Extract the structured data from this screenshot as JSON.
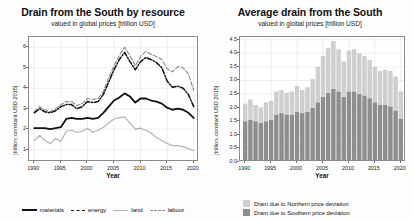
{
  "figure": {
    "background": "#fdfdfd",
    "width": 413,
    "height": 221
  },
  "panels": [
    {
      "id": "left",
      "title": "Drain from the South by resource",
      "subtitle": "valued in global prices [trillion USD]",
      "xlabel": "Year",
      "ylabel": "[trillion, constant USD 2015]"
    },
    {
      "id": "right",
      "title": "Average drain from the South",
      "subtitle": "valued in global prices [trillion USD]",
      "xlabel": "Year",
      "ylabel": "[trillion, constant USD 2015]"
    }
  ],
  "colors": {
    "materials": "#111111",
    "energy": "#111111",
    "land": "#b3b3b3",
    "labour": "#8f8f8f",
    "north_bar": "#cfcfcf",
    "south_bar": "#8e8e8e",
    "axis": "#8a8a8a",
    "grid": "#e9e9e9"
  },
  "chart_data": [
    {
      "type": "line",
      "id": "drain-by-resource",
      "title": "Drain from the South by resource",
      "subtitle": "valued in global prices [trillion USD]",
      "xlabel": "Year",
      "ylabel": "[trillion, constant USD 2015]",
      "xlim": [
        1989,
        2021
      ],
      "ylim": [
        0.4,
        6.5
      ],
      "xticks": [
        1990,
        1995,
        2000,
        2005,
        2010,
        2015,
        2020
      ],
      "yticks": [
        1,
        2,
        3,
        4,
        5,
        6
      ],
      "grid": true,
      "legend_position": "bottom",
      "x": [
        1990,
        1991,
        1992,
        1993,
        1994,
        1995,
        1996,
        1997,
        1998,
        1999,
        2000,
        2001,
        2002,
        2003,
        2004,
        2005,
        2006,
        2007,
        2008,
        2009,
        2010,
        2011,
        2012,
        2013,
        2014,
        2015,
        2016,
        2017,
        2018,
        2019,
        2020
      ],
      "series": [
        {
          "name": "materials",
          "style": "solid",
          "color": "#111111",
          "values": [
            2.05,
            2.05,
            2.05,
            2.0,
            2.05,
            2.1,
            2.5,
            2.55,
            2.5,
            2.5,
            2.55,
            2.5,
            2.55,
            2.8,
            3.1,
            3.4,
            3.55,
            3.75,
            3.6,
            3.3,
            3.5,
            3.5,
            3.4,
            3.35,
            3.25,
            3.05,
            2.95,
            3.0,
            2.95,
            2.8,
            2.55
          ]
        },
        {
          "name": "energy",
          "style": "dashdot",
          "color": "#111111",
          "values": [
            2.8,
            3.0,
            2.85,
            2.8,
            2.9,
            3.1,
            3.2,
            3.2,
            3.0,
            3.1,
            3.35,
            3.3,
            3.35,
            3.7,
            4.3,
            4.9,
            5.4,
            5.75,
            5.3,
            4.9,
            5.3,
            5.5,
            5.4,
            5.25,
            5.0,
            4.35,
            4.05,
            4.1,
            4.0,
            3.7,
            3.1
          ]
        },
        {
          "name": "land",
          "style": "solid",
          "color": "#b3b3b3",
          "values": [
            1.45,
            1.7,
            1.45,
            1.3,
            1.55,
            1.4,
            1.9,
            1.95,
            1.85,
            1.9,
            2.05,
            1.85,
            1.95,
            2.1,
            2.3,
            2.5,
            2.55,
            2.6,
            2.3,
            2.0,
            2.05,
            1.95,
            1.8,
            1.6,
            1.45,
            1.3,
            1.2,
            1.2,
            1.15,
            1.05,
            0.95
          ]
        },
        {
          "name": "labour",
          "style": "dashed",
          "color": "#8f8f8f",
          "values": [
            2.85,
            3.1,
            2.95,
            2.85,
            3.0,
            3.2,
            3.35,
            3.35,
            3.15,
            3.25,
            3.5,
            3.45,
            3.5,
            3.85,
            4.5,
            5.1,
            5.6,
            6.0,
            5.6,
            5.1,
            5.55,
            5.8,
            5.65,
            5.55,
            5.4,
            4.95,
            4.8,
            5.05,
            5.0,
            4.7,
            3.9
          ]
        }
      ]
    },
    {
      "type": "bar",
      "id": "average-drain",
      "title": "Average drain from the South",
      "subtitle": "valued in global prices [trillion USD]",
      "xlabel": "Year",
      "ylabel": "[trillion, constant USD 2015]",
      "stacked": true,
      "xlim": [
        1989,
        2021
      ],
      "ylim": [
        0.0,
        4.6
      ],
      "xticks": [
        1990,
        1995,
        2000,
        2005,
        2010,
        2015,
        2020
      ],
      "yticks": [
        "0.0",
        "0.5",
        "1.0",
        "1.5",
        "2.0",
        "2.5",
        "3.0",
        "3.5",
        "4.0",
        "4.5"
      ],
      "grid": true,
      "legend_position": "bottom-left",
      "categories": [
        1990,
        1991,
        1992,
        1993,
        1994,
        1995,
        1996,
        1997,
        1998,
        1999,
        2000,
        2001,
        2002,
        2003,
        2004,
        2005,
        2006,
        2007,
        2008,
        2009,
        2010,
        2011,
        2012,
        2013,
        2014,
        2015,
        2016,
        2017,
        2018,
        2019,
        2020
      ],
      "series": [
        {
          "name": "Drain due to Southern price deviation",
          "color": "#8e8e8e",
          "values": [
            1.5,
            1.55,
            1.5,
            1.45,
            1.5,
            1.55,
            1.75,
            1.8,
            1.75,
            1.75,
            1.85,
            1.8,
            1.85,
            2.0,
            2.2,
            2.4,
            2.55,
            2.7,
            2.6,
            2.4,
            2.6,
            2.6,
            2.5,
            2.45,
            2.35,
            2.2,
            2.1,
            2.1,
            2.05,
            1.9,
            1.6
          ]
        },
        {
          "name": "Drain due to Northern price deviation",
          "color": "#cfcfcf",
          "values": [
            0.65,
            0.75,
            0.6,
            0.55,
            0.7,
            0.7,
            0.85,
            0.85,
            0.8,
            0.85,
            0.95,
            0.85,
            0.9,
            1.05,
            1.3,
            1.5,
            1.65,
            1.75,
            1.55,
            1.3,
            1.5,
            1.55,
            1.5,
            1.45,
            1.4,
            1.3,
            1.25,
            1.3,
            1.3,
            1.25,
            1.0
          ]
        }
      ]
    }
  ],
  "legends": {
    "lines": [
      {
        "label": "materials",
        "key": "materials"
      },
      {
        "label": "energy",
        "key": "energy"
      },
      {
        "label": "land",
        "key": "land"
      },
      {
        "label": "labour",
        "key": "labour"
      }
    ],
    "bars": [
      {
        "label": "Drain due to Northern price deviation",
        "key": "north_bar"
      },
      {
        "label": "Drain due to Southern price deviation",
        "key": "south_bar"
      }
    ]
  }
}
